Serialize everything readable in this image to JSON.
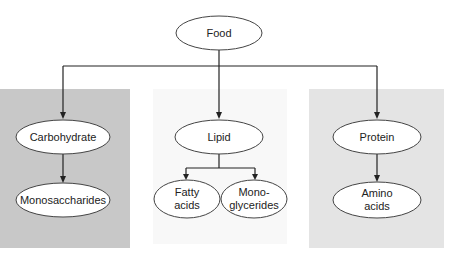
{
  "diagram": {
    "colors": {
      "panel_left": "#c8c8c8",
      "panel_mid": "#f8f8f8",
      "panel_right": "#e4e4e4",
      "ellipse_fill": "#ffffff",
      "ellipse_stroke": "#444444",
      "line": "#222222"
    },
    "nodes": {
      "food": {
        "lines": [
          "Food"
        ]
      },
      "carbohydrate": {
        "lines": [
          "Carbohydrate"
        ]
      },
      "monosaccharides": {
        "lines": [
          "Monosaccharides"
        ]
      },
      "lipid": {
        "lines": [
          "Lipid"
        ]
      },
      "fatty_acids": {
        "lines": [
          "Fatty",
          "acids"
        ]
      },
      "monoglycerides": {
        "lines": [
          "Mono-",
          "glycerides"
        ]
      },
      "protein": {
        "lines": [
          "Protein"
        ]
      },
      "amino_acids": {
        "lines": [
          "Amino",
          "acids"
        ]
      }
    },
    "edges": [
      {
        "from": "Food",
        "to": "Carbohydrate"
      },
      {
        "from": "Food",
        "to": "Lipid"
      },
      {
        "from": "Food",
        "to": "Protein"
      },
      {
        "from": "Carbohydrate",
        "to": "Monosaccharides"
      },
      {
        "from": "Lipid",
        "to": "Fatty acids"
      },
      {
        "from": "Lipid",
        "to": "Monoglycerides"
      },
      {
        "from": "Protein",
        "to": "Amino acids"
      }
    ]
  }
}
